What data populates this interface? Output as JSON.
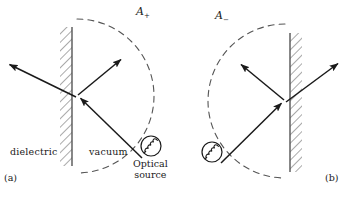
{
  "figure": {
    "width": 353,
    "height": 197,
    "background": "#ffffff",
    "stroke_color": "#1a1a1a",
    "dash_color": "#555555"
  },
  "panel_a": {
    "tag": "(a)",
    "tag_pos": {
      "x": 4,
      "y": 172
    },
    "amplitude_label": "A",
    "amplitude_sign": "+",
    "amplitude_pos": {
      "x": 136,
      "y": 7
    },
    "left_material": "dielectric",
    "left_material_pos": {
      "x": 10,
      "y": 147
    },
    "right_material": "vacuum",
    "right_material_pos": {
      "x": 89,
      "y": 147
    },
    "source_label_line1": "Optical",
    "source_label_line2": "source",
    "source_label_pos": {
      "x": 133,
      "y": 157
    },
    "interface_point": {
      "x": 77,
      "y": 96
    },
    "wall": {
      "x": 72,
      "top": 27,
      "bottom": 166,
      "hatch_side": "left"
    },
    "source_circle": {
      "cx": 151,
      "cy": 146,
      "r": 10
    },
    "arc": {
      "cx": 77,
      "cy": 96,
      "r": 77,
      "bulge": "right"
    },
    "rays": [
      {
        "name": "incident-ray",
        "from": {
          "x": 142,
          "y": 158
        },
        "to": {
          "x": 79,
          "y": 97
        },
        "arrow": "to"
      },
      {
        "name": "reflected-ray",
        "from": {
          "x": 78,
          "y": 95
        },
        "to": {
          "x": 123,
          "y": 58
        },
        "arrow": "to"
      },
      {
        "name": "transmitted-ray",
        "from": {
          "x": 76,
          "y": 97
        },
        "to": {
          "x": 7,
          "y": 63
        },
        "arrow": "to"
      }
    ]
  },
  "panel_b": {
    "tag": "(b)",
    "tag_pos": {
      "x": 325,
      "y": 172
    },
    "amplitude_label": "A",
    "amplitude_sign": "−",
    "amplitude_pos": {
      "x": 215,
      "y": 11
    },
    "interface_point": {
      "x": 285,
      "y": 101
    },
    "wall": {
      "x": 290,
      "top": 33,
      "bottom": 172,
      "hatch_side": "right"
    },
    "source_circle": {
      "cx": 212,
      "cy": 152,
      "r": 10
    },
    "arc": {
      "cx": 285,
      "cy": 101,
      "r": 77,
      "bulge": "left"
    },
    "rays": [
      {
        "name": "incident-ray",
        "from": {
          "x": 221,
          "y": 163
        },
        "to": {
          "x": 283,
          "y": 102
        },
        "arrow": "to"
      },
      {
        "name": "reflected-ray",
        "from": {
          "x": 284,
          "y": 100
        },
        "to": {
          "x": 239,
          "y": 63
        },
        "arrow": "to"
      },
      {
        "name": "transmitted-ray",
        "from": {
          "x": 286,
          "y": 102
        },
        "to": {
          "x": 340,
          "y": 62
        },
        "arrow": "to"
      }
    ]
  }
}
